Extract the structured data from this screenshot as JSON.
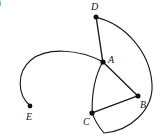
{
  "figure": {
    "background_color": "#ffffff",
    "stroke_color": "#1a1a1a",
    "width": 166,
    "height": 139,
    "corner_mark": {
      "text": ")",
      "note": "partially cropped bold character at left edge"
    },
    "points": [
      {
        "id": "A",
        "label": "A",
        "x": 103,
        "y": 62,
        "label_x": 108,
        "label_y": 55
      },
      {
        "id": "B",
        "label": "B",
        "x": 138,
        "y": 96,
        "label_x": 140,
        "label_y": 100
      },
      {
        "id": "C",
        "label": "C",
        "x": 92,
        "y": 113,
        "label_x": 83,
        "label_y": 117
      },
      {
        "id": "D",
        "label": "D",
        "x": 96,
        "y": 17,
        "label_x": 91,
        "label_y": 2
      },
      {
        "id": "E",
        "label": "E",
        "x": 30,
        "y": 106,
        "label_x": 26,
        "label_y": 112
      }
    ],
    "segments": [
      {
        "id": "DA",
        "from": "D",
        "to": "A",
        "kind": "line"
      },
      {
        "id": "AB",
        "from": "A",
        "to": "B",
        "kind": "line"
      },
      {
        "id": "BC",
        "from": "B",
        "to": "C",
        "kind": "line"
      },
      {
        "id": "AC",
        "from": "A",
        "to": "C",
        "kind": "curve"
      }
    ],
    "arcs": [
      {
        "id": "EA",
        "from": "E",
        "to": "A",
        "kind": "arc",
        "note": "long arc bulging up and left"
      },
      {
        "id": "DC",
        "from": "D",
        "to": "C",
        "kind": "arc",
        "note": "long arc bulging right past B"
      }
    ],
    "paths": {
      "seg_DA": "M 96.2 17.4 L 102.8 61.8",
      "seg_AB": "M 102.8 61.8 L 137.6 95.8",
      "seg_BC": "M 137.6 95.8 L 92.2 112.8",
      "curve_AC": "M 102.8 61.8 C 96.0 74.0 91.6 92.0 92.2 112.8",
      "arc_EA": "M 30.2 105.8 C 17.0 95.0 16.5 72.0 31.0 60.0 C 46.0 47.5 78.0 48.5 102.8 61.8",
      "arc_DC": "M 96.2 17.4 C 125.0 24.0 150.0 52.0 152.0 84.0 C 153.6 110.0 130.0 131.0 104.0 133.0 C 99.0 127.0 94.5 120.0 92.2 112.8"
    }
  }
}
